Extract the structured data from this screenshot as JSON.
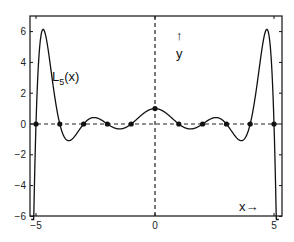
{
  "chart_data": {
    "type": "line",
    "title": "",
    "function_label": "L_5(x)",
    "function_label_main": "L",
    "function_label_sub": "5",
    "function_label_tail": "(x)",
    "xlabel": "x→",
    "ylabel_arrow": "↑",
    "ylabel": "y",
    "xlim": [
      -5.2,
      5.3
    ],
    "ylim": [
      -6,
      7
    ],
    "x_ticks": [
      -5,
      0,
      5
    ],
    "x_tick_labels": [
      "−5",
      "0",
      "5"
    ],
    "y_ticks": [
      -6,
      -4,
      -2,
      0,
      2,
      4,
      6
    ],
    "y_tick_labels": [
      "−6",
      "−4",
      "−2",
      "0",
      "2",
      "4",
      "6"
    ],
    "grid": false,
    "nodes_x": [
      -5,
      -4,
      -3,
      -2,
      -1,
      0,
      1,
      2,
      3,
      4,
      5
    ],
    "nodes_y": [
      0,
      0,
      0,
      0,
      0,
      1,
      0,
      0,
      0,
      0,
      0
    ],
    "series": [
      {
        "name": "L5(x)",
        "style": "solid",
        "x": [
          -5.15,
          -5.0,
          -4.8,
          -4.6,
          -4.4,
          -4.2,
          -4.0,
          -3.8,
          -3.6,
          -3.4,
          -3.2,
          -3.0,
          -2.7,
          -2.5,
          -2.3,
          -2.0,
          -1.7,
          -1.5,
          -1.3,
          -1.0,
          -0.7,
          -0.5,
          -0.3,
          0,
          0.3,
          0.5,
          0.7,
          1.0,
          1.3,
          1.5,
          1.7,
          2.0,
          2.3,
          2.5,
          2.7,
          3.0,
          3.2,
          3.4,
          3.6,
          3.8,
          4.0,
          4.2,
          4.4,
          4.6,
          4.8,
          5.0,
          5.15
        ],
        "y": [
          -6,
          0,
          4.8,
          6.1,
          5.0,
          2.6,
          0,
          -0.9,
          -1.1,
          -0.8,
          -0.4,
          0,
          0.32,
          0.38,
          0.3,
          0,
          -0.22,
          -0.26,
          -0.2,
          0,
          0.45,
          0.75,
          0.93,
          1.0,
          0.93,
          0.75,
          0.45,
          0,
          -0.2,
          -0.26,
          -0.22,
          0,
          0.3,
          0.38,
          0.32,
          0,
          -0.4,
          -0.8,
          -1.1,
          -0.9,
          0,
          2.6,
          5.0,
          6.1,
          4.8,
          0,
          -6
        ]
      },
      {
        "name": "y=0 axis",
        "style": "dashed"
      },
      {
        "name": "x=0 axis",
        "style": "dashed"
      }
    ]
  }
}
